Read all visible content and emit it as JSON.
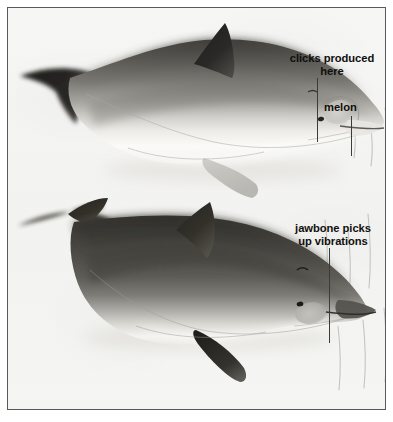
{
  "figure": {
    "kind": "scientific-illustration",
    "background_color": "#f4f4f2",
    "border_color": "#5a5a58",
    "ink_color": "#100f0d"
  },
  "labels": [
    {
      "id": "clicks",
      "text": "clicks produced\nhere",
      "target": "melon / nasal sacs of upper dolphin"
    },
    {
      "id": "melon",
      "text": "melon",
      "target": "forehead melon of upper dolphin"
    },
    {
      "id": "jawbone",
      "text": "jawbone picks\nup vibrations",
      "target": "lower jaw of lower dolphin"
    }
  ],
  "specimens": [
    {
      "id": "upper-dolphin",
      "name": "dolphin-upper",
      "orientation": "facing right",
      "shading": "light dorsal cape with pale belly",
      "highlights": [
        "melon",
        "blowhole",
        "eye",
        "pectoral-fin",
        "dorsal-fin",
        "fluke"
      ]
    },
    {
      "id": "lower-dolphin",
      "name": "dolphin-lower",
      "orientation": "facing right",
      "shading": "dark dorsal cape with pale belly",
      "highlights": [
        "jaw-panel",
        "eye",
        "pectoral-fin",
        "dorsal-fin",
        "fluke"
      ]
    }
  ],
  "sound_lines": {
    "name": "sound-wave-lines",
    "count": 7,
    "color": "#b9b9b5",
    "description": "faint vertical strokes at right edge representing sound"
  }
}
